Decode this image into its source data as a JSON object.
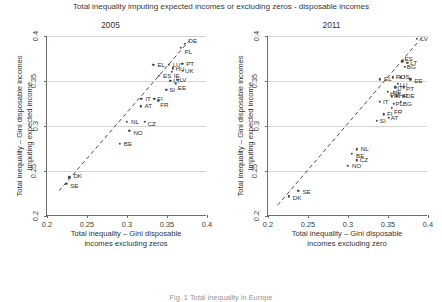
{
  "figure": {
    "suptitle": "Total inequality imputing expected incomes or excluding zeros - disposable incomes",
    "caption": "Fig. 1 Total inequality in Europe"
  },
  "chart_data": [
    {
      "type": "scatter",
      "title": "2005",
      "xlabel_line1": "Total inequality – Gini disposable",
      "xlabel_line2": "incomes excluding zeros",
      "ylabel_line1": "Total inequality – Gini disposable incomes",
      "ylabel_line2": "imputing expected income",
      "xlim": [
        0.2,
        0.4
      ],
      "ylim": [
        0.2,
        0.4
      ],
      "xticks": [
        "0.2",
        "0.25",
        "0.3",
        "0.35",
        "0.4"
      ],
      "xtick_values": [
        0.2,
        0.25,
        0.3,
        0.35,
        0.4
      ],
      "yticks": [
        "0.2",
        "0.25",
        "0.3",
        "0.35",
        "0.4"
      ],
      "ytick_values": [
        0.2,
        0.25,
        0.3,
        0.35,
        0.4
      ],
      "grid": "horizontal",
      "reference_line": {
        "style": "dashed",
        "from": [
          0.215,
          0.228
        ],
        "to": [
          0.378,
          0.395
        ]
      },
      "points": [
        {
          "label": "DE",
          "x": 0.372,
          "y": 0.391,
          "lx": 4,
          "ly": -6
        },
        {
          "label": "PL",
          "x": 0.367,
          "y": 0.387,
          "lx": 4,
          "ly": 1
        },
        {
          "label": "EL",
          "x": 0.333,
          "y": 0.368,
          "lx": 4,
          "ly": -3
        },
        {
          "label": "LU",
          "x": 0.352,
          "y": 0.368,
          "lx": 4,
          "ly": -3
        },
        {
          "label": "PT",
          "x": 0.369,
          "y": 0.369,
          "lx": 4,
          "ly": -3
        },
        {
          "label": "HU",
          "x": 0.357,
          "y": 0.364,
          "lx": 3,
          "ly": -2
        },
        {
          "label": "IE",
          "x": 0.356,
          "y": 0.36,
          "lx": 2,
          "ly": 1
        },
        {
          "label": "UK",
          "x": 0.37,
          "y": 0.361,
          "lx": 2,
          "ly": 0
        },
        {
          "label": "ES",
          "x": 0.34,
          "y": 0.356,
          "lx": 4,
          "ly": -3
        },
        {
          "label": "LT",
          "x": 0.354,
          "y": 0.35,
          "lx": 3,
          "ly": -3
        },
        {
          "label": "LV",
          "x": 0.363,
          "y": 0.351,
          "lx": 2,
          "ly": -3
        },
        {
          "label": "EE",
          "x": 0.361,
          "y": 0.347,
          "lx": 2,
          "ly": 1
        },
        {
          "label": "SI",
          "x": 0.349,
          "y": 0.34,
          "lx": 3,
          "ly": -3
        },
        {
          "label": "FI",
          "x": 0.334,
          "y": 0.33,
          "lx": 3,
          "ly": -3
        },
        {
          "label": "FR",
          "x": 0.339,
          "y": 0.328,
          "lx": 2,
          "ly": 1
        },
        {
          "label": "IT",
          "x": 0.318,
          "y": 0.33,
          "lx": 4,
          "ly": -3
        },
        {
          "label": "AT",
          "x": 0.317,
          "y": 0.322,
          "lx": 4,
          "ly": -3
        },
        {
          "label": "NL",
          "x": 0.3,
          "y": 0.305,
          "lx": 4,
          "ly": -3
        },
        {
          "label": "CZ",
          "x": 0.322,
          "y": 0.305,
          "lx": 3,
          "ly": -1
        },
        {
          "label": "NO",
          "x": 0.303,
          "y": 0.295,
          "lx": 4,
          "ly": -1
        },
        {
          "label": "BE",
          "x": 0.291,
          "y": 0.28,
          "lx": 4,
          "ly": -3
        },
        {
          "label": "DK",
          "x": 0.228,
          "y": 0.243,
          "lx": 4,
          "ly": -4
        },
        {
          "label": "SE",
          "x": 0.224,
          "y": 0.236,
          "lx": 4,
          "ly": -1
        }
      ]
    },
    {
      "type": "scatter",
      "title": "2011",
      "xlabel_line1": "Total inequality – Gini disposable",
      "xlabel_line2": "incomes excluding zero",
      "ylabel_line1": "Total inequality – Gini disposable incomes",
      "ylabel_line2": "imputing expected income",
      "xlim": [
        0.2,
        0.4
      ],
      "ylim": [
        0.2,
        0.4
      ],
      "xticks": [
        "0.2",
        "0.25",
        "0.3",
        "0.35",
        "0.4"
      ],
      "xtick_values": [
        0.2,
        0.25,
        0.3,
        0.35,
        0.4
      ],
      "yticks": [
        "0.2",
        "0.25",
        "0.3",
        "0.35",
        "0.4"
      ],
      "ytick_values": [
        0.2,
        0.25,
        0.3,
        0.35,
        0.4
      ],
      "grid": "horizontal",
      "reference_line": {
        "style": "dashed",
        "from": [
          0.212,
          0.212
        ],
        "to": [
          0.392,
          0.398
        ]
      },
      "points": [
        {
          "label": "LV",
          "x": 0.386,
          "y": 0.397,
          "lx": 4,
          "ly": -3
        },
        {
          "label": "ES",
          "x": 0.368,
          "y": 0.372,
          "lx": 2,
          "ly": -5
        },
        {
          "label": "LT",
          "x": 0.374,
          "y": 0.37,
          "lx": 3,
          "ly": -3
        },
        {
          "label": "BG",
          "x": 0.371,
          "y": 0.366,
          "lx": 2,
          "ly": 0
        },
        {
          "label": "EL",
          "x": 0.34,
          "y": 0.352,
          "lx": 4,
          "ly": -3
        },
        {
          "label": "RO",
          "x": 0.356,
          "y": 0.354,
          "lx": 3,
          "ly": -3
        },
        {
          "label": "IS",
          "x": 0.366,
          "y": 0.354,
          "lx": 3,
          "ly": -3
        },
        {
          "label": "EE",
          "x": 0.378,
          "y": 0.352,
          "lx": 4,
          "ly": -1
        },
        {
          "label": "LU",
          "x": 0.362,
          "y": 0.347,
          "lx": 2,
          "ly": -2
        },
        {
          "label": "IT",
          "x": 0.359,
          "y": 0.343,
          "lx": 2,
          "ly": -2
        },
        {
          "label": "PT",
          "x": 0.37,
          "y": 0.343,
          "lx": 2,
          "ly": -1
        },
        {
          "label": "HU",
          "x": 0.35,
          "y": 0.338,
          "lx": 2,
          "ly": -1
        },
        {
          "label": "IE",
          "x": 0.357,
          "y": 0.338,
          "lx": 2,
          "ly": 0
        },
        {
          "label": "FI",
          "x": 0.355,
          "y": 0.333,
          "lx": 2,
          "ly": 0
        },
        {
          "label": "HR",
          "x": 0.361,
          "y": 0.333,
          "lx": 2,
          "ly": 0
        },
        {
          "label": "DE",
          "x": 0.37,
          "y": 0.333,
          "lx": 2,
          "ly": 0
        },
        {
          "label": "IT2",
          "x": 0.34,
          "y": 0.327,
          "lx": 3,
          "ly": -3
        },
        {
          "label": "PL",
          "x": 0.357,
          "y": 0.325,
          "lx": 2,
          "ly": 0
        },
        {
          "label": "BG2",
          "x": 0.366,
          "y": 0.327,
          "lx": 2,
          "ly": -1
        },
        {
          "label": "FR",
          "x": 0.355,
          "y": 0.32,
          "lx": 2,
          "ly": 1
        },
        {
          "label": "FI2",
          "x": 0.345,
          "y": 0.313,
          "lx": 3,
          "ly": -3
        },
        {
          "label": "AT",
          "x": 0.351,
          "y": 0.309,
          "lx": 2,
          "ly": 0
        },
        {
          "label": "SI",
          "x": 0.336,
          "y": 0.306,
          "lx": 3,
          "ly": 0
        },
        {
          "label": "NL",
          "x": 0.311,
          "y": 0.274,
          "lx": 4,
          "ly": -3
        },
        {
          "label": "BE",
          "x": 0.305,
          "y": 0.269,
          "lx": 4,
          "ly": -1
        },
        {
          "label": "CZ",
          "x": 0.311,
          "y": 0.262,
          "lx": 3,
          "ly": 0
        },
        {
          "label": "NO",
          "x": 0.3,
          "y": 0.256,
          "lx": 4,
          "ly": 0
        },
        {
          "label": "SE",
          "x": 0.238,
          "y": 0.228,
          "lx": 4,
          "ly": -2
        },
        {
          "label": "DK",
          "x": 0.226,
          "y": 0.222,
          "lx": 4,
          "ly": -1
        }
      ]
    }
  ]
}
